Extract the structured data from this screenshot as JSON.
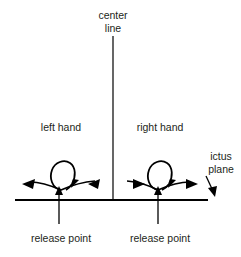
{
  "diagram": {
    "title_text_elements": {
      "center_line_1": "center",
      "center_line_2": "line",
      "left_hand": "left hand",
      "right_hand": "right hand",
      "ictus_1": "ictus",
      "ictus_2": "plane",
      "release_left": "release point",
      "release_right": "release point"
    },
    "colors": {
      "background": "#ffffff",
      "stroke": "#000000",
      "text": "#231f20"
    },
    "elements": {
      "center_line_name": "center line",
      "ictus_plane_name": "ictus plane",
      "left_hand_name": "left hand gesture",
      "right_hand_name": "right hand gesture",
      "release_point_name": "release point"
    }
  }
}
